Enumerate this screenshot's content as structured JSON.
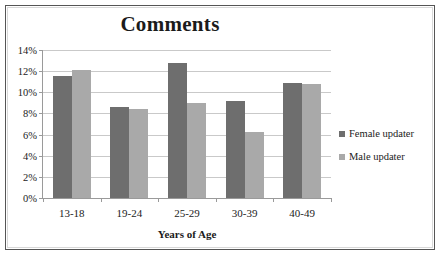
{
  "chart_data": {
    "type": "bar",
    "title": "Comments",
    "xlabel": "Years of Age",
    "ylabel": "",
    "categories": [
      "13-18",
      "19-24",
      "25-29",
      "30-39",
      "40-49"
    ],
    "series": [
      {
        "name": "Female updater",
        "color": "#6e6e6e",
        "values": [
          11.5,
          8.6,
          12.8,
          9.2,
          10.9
        ]
      },
      {
        "name": "Male updater",
        "color": "#a9a9a9",
        "values": [
          12.1,
          8.4,
          9.0,
          6.2,
          10.8
        ]
      }
    ],
    "ylim": [
      0,
      14
    ],
    "ytick_values": [
      0,
      2,
      4,
      6,
      8,
      10,
      12,
      14
    ],
    "ytick_labels": [
      "0%",
      "2%",
      "4%",
      "6%",
      "8%",
      "10%",
      "12%",
      "14%"
    ],
    "grid": true,
    "legend_position": "right",
    "units": "percent"
  },
  "legend": {
    "items": [
      {
        "label": "Female updater",
        "swatch": "female"
      },
      {
        "label": "Male updater",
        "swatch": "male"
      }
    ]
  }
}
